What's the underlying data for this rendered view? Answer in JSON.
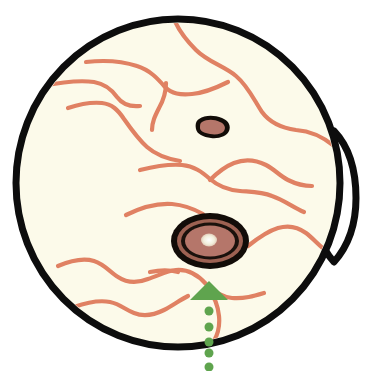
{
  "figure": {
    "name": "retinal-fundus-diagram",
    "title": "Fundus diagram with macular lesion and green arrow marker",
    "canvas": {
      "width": 370,
      "height": 371,
      "background": "#ffffff"
    }
  },
  "colors": {
    "outline": "#0d0d0d",
    "fundus_fill": "#fcfaea",
    "vessel": "#e08163",
    "vessel_dark": "#d97a5c",
    "lesion_ring": "#120c08",
    "lesion_fill": "#b5766a",
    "lesion_fill_dark": "#a26457",
    "lesion_center": "#f2efdc",
    "optic_disc_fill": "#ffffff",
    "marker_green": "#5fa44e"
  },
  "eyeball": {
    "label": "fundus-globe",
    "center": {
      "cx": 178,
      "cy": 183
    },
    "radius": {
      "rx": 162,
      "ry": 164
    },
    "stroke_width": 7
  },
  "optic_disc": {
    "label": "optic-disc",
    "shape": "lens",
    "center": {
      "cx": 334,
      "cy": 196
    },
    "width": 44,
    "height": 130,
    "stroke_width": 7
  },
  "macular_lesion": {
    "label": "macular-lesion",
    "center": {
      "cx": 210,
      "cy": 241
    },
    "rings": [
      {
        "rx": 39,
        "ry": 28,
        "fill": "#120c08"
      },
      {
        "rx": 33,
        "ry": 22,
        "fill": "#a26457"
      },
      {
        "rx": 29,
        "ry": 18.5,
        "fill": "#120c08"
      },
      {
        "rx": 25,
        "ry": 15.5,
        "fill": "#b5766a"
      }
    ],
    "center_spot": {
      "rx": 8,
      "ry": 6.5,
      "fill": "#f2efdc"
    }
  },
  "secondary_lesion": {
    "label": "secondary-lesion",
    "center": {
      "cx": 213,
      "cy": 127
    },
    "rx": 17,
    "ry": 10,
    "ring_fill": "#120c08",
    "inner_rx": 12.5,
    "inner_ry": 6,
    "inner_fill": "#b5766a"
  },
  "marker": {
    "label": "green-arrow-marker",
    "arrow": {
      "apex": {
        "x": 209,
        "y": 281
      },
      "left": {
        "x": 190,
        "y": 300
      },
      "right": {
        "x": 228,
        "y": 300
      },
      "fill": "#5fa44e"
    },
    "trail_dots": [
      {
        "cx": 209,
        "cy": 311,
        "r": 4.5
      },
      {
        "cx": 209,
        "cy": 327,
        "r": 4.5
      },
      {
        "cx": 209,
        "cy": 342,
        "r": 4.5
      },
      {
        "cx": 209,
        "cy": 353,
        "r": 4.5
      },
      {
        "cx": 209,
        "cy": 367,
        "r": 4.5
      }
    ],
    "dot_fill": "#5fa44e"
  },
  "vessels": [
    {
      "id": "vessel-superior-main",
      "stroke_width": 4.2,
      "d": "M 172 13 C 176 28, 186 40, 196 50 C 208 62, 224 66, 236 76 C 248 86, 254 100, 262 112 C 270 123, 282 128, 296 130 C 310 131, 322 136, 334 146"
    },
    {
      "id": "vessel-superior-branch-left",
      "stroke_width": 4.2,
      "d": "M 86 62 C 104 60, 122 61, 137 66 C 150 70, 158 79, 165 87 C 172 94, 180 95, 192 94 C 204 93, 216 88, 228 82"
    },
    {
      "id": "vessel-mid-upper",
      "stroke_width": 4.2,
      "d": "M 166 83 C 166 93, 163 101, 159 108 C 155 116, 152 122, 152 130"
    },
    {
      "id": "vessel-temporal-arch",
      "stroke_width": 4.2,
      "d": "M 42 86 C 62 82, 80 80, 94 82 C 106 84, 112 90, 117 97 C 123 105, 131 107, 140 106"
    },
    {
      "id": "vessel-arch-descend",
      "stroke_width": 4.2,
      "d": "M 68 108 C 80 104, 92 102, 102 103 C 112 104, 118 110, 124 119 C 131 129, 138 139, 147 147 C 156 155, 168 159, 180 161"
    },
    {
      "id": "vessel-mid-horizontal",
      "stroke_width": 4.2,
      "d": "M 140 170 C 156 166, 170 164, 182 165 C 194 166, 202 172, 210 179 C 218 186, 228 190, 240 191 C 252 192, 262 192, 272 196 C 284 200, 294 208, 304 212"
    },
    {
      "id": "vessel-right-branch",
      "stroke_width": 4.2,
      "d": "M 210 180 C 216 174, 224 167, 234 163 C 244 159, 256 160, 266 165 C 274 169, 280 176, 288 180 C 296 184, 304 186, 312 186"
    },
    {
      "id": "vessel-above-macula",
      "stroke_width": 4.2,
      "d": "M 126 215 C 142 207, 158 203, 172 204 C 184 205, 194 209, 203 214"
    },
    {
      "id": "vessel-lower-right",
      "stroke_width": 4.2,
      "d": "M 248 246 C 258 238, 268 231, 278 228 C 288 225, 298 227, 306 233 C 314 239, 320 247, 328 252"
    },
    {
      "id": "vessel-inferior-arch",
      "stroke_width": 4.2,
      "d": "M 58 266 C 72 260, 84 258, 94 261 C 104 264, 110 272, 118 277 C 127 283, 138 283, 148 279 C 158 276, 166 271, 176 270 C 188 269, 198 275, 206 284 C 214 292, 222 297, 232 298 C 244 299, 254 296, 264 293"
    },
    {
      "id": "vessel-inferior-lower",
      "stroke_width": 4.2,
      "d": "M 74 307 C 88 302, 100 300, 110 302 C 120 304, 126 310, 134 313 C 144 317, 154 315, 164 310 C 172 306, 180 300, 188 296"
    },
    {
      "id": "vessel-inferior-tail",
      "stroke_width": 4.2,
      "d": "M 208 288 C 214 296, 218 306, 219 316 C 220 326, 218 334, 214 341"
    },
    {
      "id": "vessel-macula-left-feed",
      "stroke_width": 4.2,
      "d": "M 150 272 C 160 270, 170 270, 178 272"
    }
  ]
}
